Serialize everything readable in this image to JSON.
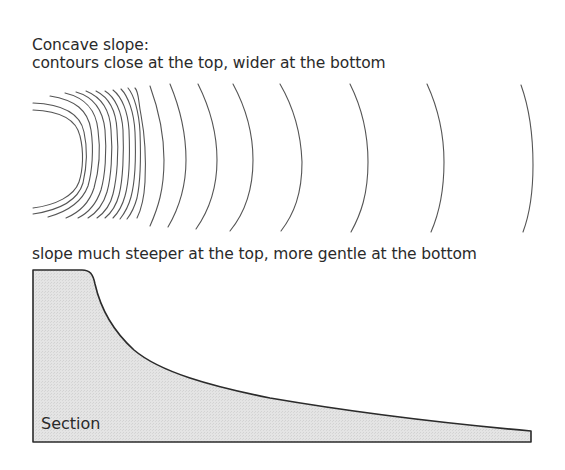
{
  "header": {
    "title": "Concave slope:",
    "subtitle": "contours close at the top, wider at the bottom"
  },
  "contour_map": {
    "description": "Plan view contour lines: tightly spaced at the left (top of slope), progressively wider spacing to the right (bottom of slope)",
    "line_count": 20,
    "stroke_color": "#555555"
  },
  "section": {
    "caption": "slope much steeper at the top, more gentle at the bottom",
    "label": "Section",
    "fill_color": "#e2e2e2",
    "stroke_color": "#2b2b2b"
  }
}
